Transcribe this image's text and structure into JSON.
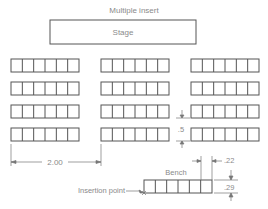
{
  "title": "Multiple insert",
  "stage": {
    "label": "Stage"
  },
  "bench": {
    "label": "Bench"
  },
  "dimensions": {
    "row_spacing": ".5",
    "column_spacing": "2.00",
    "seat_width": ".22",
    "bench_height": ".29"
  },
  "annotations": {
    "insertion_point": "Insertion point"
  },
  "layout": {
    "rows": 4,
    "columns": 3,
    "seats_per_bench": 6
  },
  "colors": {
    "line": "#555555",
    "text": "#8a8a8a"
  }
}
